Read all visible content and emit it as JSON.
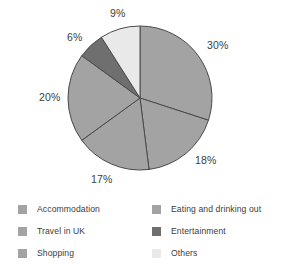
{
  "chart_data": {
    "type": "pie",
    "title": "",
    "labels": [
      "Accommodation",
      "Eating and drinking out",
      "Travel in UK",
      "Shopping",
      "Entertainment",
      "Others"
    ],
    "values": [
      30,
      18,
      17,
      20,
      6,
      9
    ],
    "value_labels": [
      "30%",
      "18%",
      "17%",
      "20%",
      "6%",
      "9%"
    ],
    "unit": "%",
    "start_angle": 0,
    "direction": "clockwise",
    "legend_position": "bottom",
    "grid": false,
    "slices": [
      {
        "label": "Accommodation",
        "value": 30,
        "value_label": "30%",
        "color": "#a3a3a3"
      },
      {
        "label": "Eating and drinking out",
        "value": 18,
        "value_label": "18%",
        "color": "#a3a3a3"
      },
      {
        "label": "Travel in UK",
        "value": 17,
        "value_label": "17%",
        "color": "#a3a3a3"
      },
      {
        "label": "Shopping",
        "value": 20,
        "value_label": "20%",
        "color": "#a3a3a3"
      },
      {
        "label": "Entertainment",
        "value": 6,
        "value_label": "6%",
        "color": "#6f6f6f"
      },
      {
        "label": "Others",
        "value": 9,
        "value_label": "9%",
        "color": "#e9e9e9"
      }
    ]
  },
  "pie": {
    "center_x": 140,
    "center_y": 98,
    "radius": 72,
    "stroke_color": "#4a4a4a",
    "labels": [
      {
        "name": "value-label-9",
        "text": "9%",
        "x": 110,
        "y": 8
      },
      {
        "name": "value-label-6",
        "text": "6%",
        "x": 67,
        "y": 32
      },
      {
        "name": "value-label-30",
        "text": "30%",
        "x": 207,
        "y": 40
      },
      {
        "name": "value-label-20",
        "text": "20%",
        "x": 39,
        "y": 92
      },
      {
        "name": "value-label-18",
        "text": "18%",
        "x": 195,
        "y": 155
      },
      {
        "name": "value-label-17",
        "text": "17%",
        "x": 91,
        "y": 174
      }
    ]
  },
  "legend": {
    "columns": [
      {
        "name": "legend-column-left",
        "items": [
          {
            "label": "Accommodation",
            "color": "#a3a3a3"
          },
          {
            "label": "Travel in UK",
            "color": "#a3a3a3"
          },
          {
            "label": "Shopping",
            "color": "#a3a3a3"
          }
        ]
      },
      {
        "name": "legend-column-right",
        "items": [
          {
            "label": "Eating and drinking out",
            "color": "#a3a3a3"
          },
          {
            "label": "Entertainment",
            "color": "#6f6f6f"
          },
          {
            "label": "Others",
            "color": "#e9e9e9"
          }
        ]
      }
    ]
  },
  "colors": {
    "background": "#ffffff",
    "medium_gray": "#a3a3a3",
    "dark_gray": "#6f6f6f",
    "light_gray": "#e9e9e9",
    "outline": "#4a4a4a",
    "text": "#3c3c3c"
  }
}
